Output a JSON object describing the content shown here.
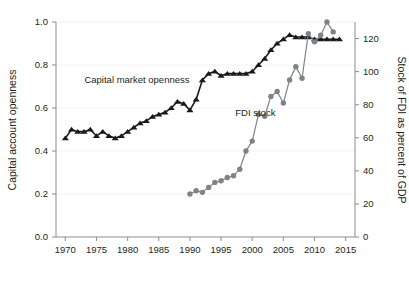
{
  "chart_data": {
    "type": "line",
    "title": "",
    "xlabel": "",
    "ylabel": "Capital account openness",
    "y2label": "Stock of FDI as percent of GDP",
    "xlim": [
      1968.5,
      2016.5
    ],
    "ylim": [
      0.0,
      1.0
    ],
    "y2lim": [
      0,
      130
    ],
    "grid": false,
    "legend_position": "inline-annotations",
    "x_ticks": [
      "1970",
      "1975",
      "1980",
      "1985",
      "1990",
      "1995",
      "2000",
      "2005",
      "2010",
      "2015"
    ],
    "x_tick_values": [
      1970,
      1975,
      1980,
      1985,
      1990,
      1995,
      2000,
      2005,
      2010,
      2015
    ],
    "y_ticks": [
      "0.0",
      "0.2",
      "0.4",
      "0.6",
      "0.8",
      "1.0"
    ],
    "y_tick_values": [
      0.0,
      0.2,
      0.4,
      0.6,
      0.8,
      1.0
    ],
    "y2_ticks": [
      "0",
      "20",
      "40",
      "60",
      "80",
      "100",
      "120"
    ],
    "y2_tick_values": [
      0,
      20,
      40,
      60,
      80,
      100,
      120
    ],
    "series": [
      {
        "name": "Capital market openness",
        "axis": "left",
        "color": "#1a1a1a",
        "marker": "triangle",
        "x": [
          1970,
          1971,
          1972,
          1973,
          1974,
          1975,
          1976,
          1977,
          1978,
          1979,
          1980,
          1981,
          1982,
          1983,
          1984,
          1985,
          1986,
          1987,
          1988,
          1989,
          1990,
          1991,
          1992,
          1993,
          1994,
          1995,
          1996,
          1997,
          1998,
          1999,
          2000,
          2001,
          2002,
          2003,
          2004,
          2005,
          2006,
          2007,
          2008,
          2009,
          2010,
          2011,
          2012,
          2013,
          2014
        ],
        "values": [
          0.46,
          0.5,
          0.49,
          0.49,
          0.5,
          0.47,
          0.49,
          0.47,
          0.46,
          0.47,
          0.49,
          0.51,
          0.53,
          0.54,
          0.56,
          0.57,
          0.58,
          0.6,
          0.63,
          0.62,
          0.59,
          0.64,
          0.73,
          0.76,
          0.77,
          0.75,
          0.76,
          0.76,
          0.76,
          0.76,
          0.77,
          0.8,
          0.83,
          0.87,
          0.9,
          0.92,
          0.94,
          0.93,
          0.93,
          0.93,
          0.92,
          0.92,
          0.92,
          0.92,
          0.92
        ],
        "label": "Capital market openness",
        "label_x": 1981.5,
        "label_y": 0.715
      },
      {
        "name": "FDI stock",
        "axis": "right",
        "color": "#808285",
        "marker": "circle",
        "x": [
          1990,
          1991,
          1992,
          1993,
          1994,
          1995,
          1996,
          1997,
          1998,
          1999,
          2000,
          2001,
          2002,
          2003,
          2004,
          2005,
          2006,
          2007,
          2008,
          2009,
          2010,
          2011,
          2012,
          2013
        ],
        "values": [
          26,
          28,
          27,
          30,
          33,
          34,
          36,
          37,
          41,
          52,
          58,
          74,
          73,
          85,
          88,
          81,
          95,
          103,
          96,
          123,
          118,
          122,
          130,
          124
        ],
        "values_left_scale": [
          0.205,
          0.22,
          0.21,
          0.23,
          0.255,
          0.265,
          0.28,
          0.29,
          0.325,
          0.405,
          0.45,
          0.575,
          0.565,
          0.66,
          0.685,
          0.635,
          0.745,
          0.81,
          0.75,
          0.955,
          0.915,
          0.945,
          1.0,
          0.955
        ],
        "label": "FDI stock",
        "label_x": 2000.5,
        "label_y": 0.565
      }
    ]
  }
}
